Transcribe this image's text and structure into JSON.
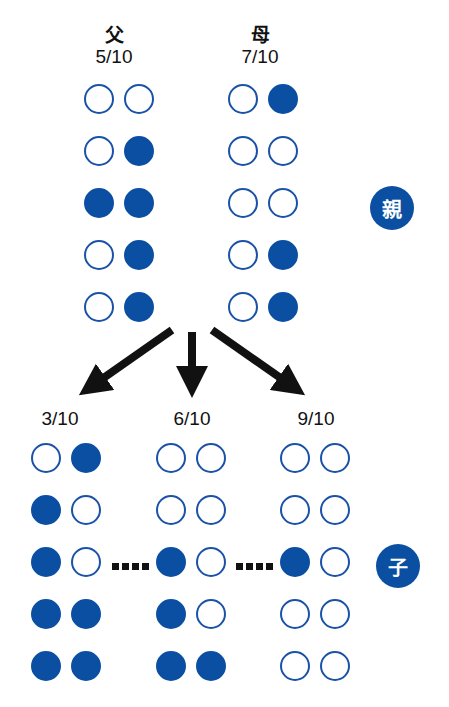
{
  "parents": {
    "father": {
      "title": "父",
      "score": "5/10",
      "alleles": [
        [
          0,
          0
        ],
        [
          0,
          1
        ],
        [
          1,
          1
        ],
        [
          0,
          1
        ],
        [
          0,
          1
        ]
      ]
    },
    "mother": {
      "title": "母",
      "score": "7/10",
      "alleles": [
        [
          0,
          1
        ],
        [
          0,
          0
        ],
        [
          0,
          0
        ],
        [
          0,
          1
        ],
        [
          0,
          1
        ]
      ]
    }
  },
  "children": [
    {
      "score": "3/10",
      "alleles": [
        [
          0,
          1
        ],
        [
          1,
          0
        ],
        [
          1,
          0
        ],
        [
          1,
          1
        ],
        [
          1,
          1
        ]
      ]
    },
    {
      "score": "6/10",
      "alleles": [
        [
          0,
          0
        ],
        [
          0,
          0
        ],
        [
          1,
          0
        ],
        [
          1,
          0
        ],
        [
          1,
          1
        ]
      ]
    },
    {
      "score": "9/10",
      "alleles": [
        [
          0,
          0
        ],
        [
          0,
          0
        ],
        [
          1,
          0
        ],
        [
          0,
          0
        ],
        [
          0,
          0
        ]
      ]
    }
  ],
  "badges": {
    "parent": "親",
    "child": "子"
  },
  "colors": {
    "filled": "#0b4fa3",
    "outline": "#1a52a8",
    "arrow": "#111111"
  }
}
